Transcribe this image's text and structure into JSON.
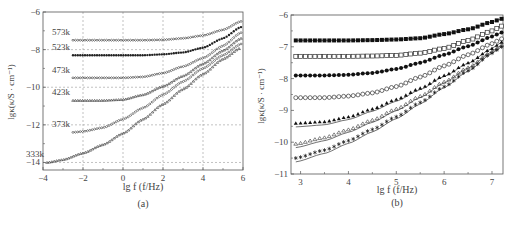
{
  "chart_data": [
    {
      "panel": "(a)",
      "type": "scatter",
      "title": "",
      "xlabel": "lg f (f/Hz)",
      "ylabel": "lgκ(κ/S · cm⁻¹)",
      "xlim": [
        -4,
        6
      ],
      "ylim": [
        -14.4,
        -6
      ],
      "xticks": [
        -4,
        -2,
        0,
        2,
        4,
        6
      ],
      "yticks": [
        -6,
        -8,
        -10,
        -12,
        -14
      ],
      "grid": true,
      "grid_style": "dashed",
      "legend": "inline labels",
      "series": [
        {
          "name": "573k",
          "marker": "open-diamond",
          "x": [
            -2.5,
            -1,
            0,
            1,
            2,
            3,
            4,
            5,
            5.9
          ],
          "y": [
            -7.5,
            -7.5,
            -7.5,
            -7.5,
            -7.48,
            -7.4,
            -7.25,
            -6.95,
            -6.5
          ]
        },
        {
          "name": "523k",
          "marker": "filled-dot",
          "x": [
            -2.5,
            -1,
            0,
            1,
            2,
            3,
            4,
            5,
            5.9
          ],
          "y": [
            -8.3,
            -8.3,
            -8.3,
            -8.3,
            -8.25,
            -8.15,
            -7.9,
            -7.4,
            -6.8
          ]
        },
        {
          "name": "473k",
          "marker": "open-diamond",
          "x": [
            -2.5,
            -1,
            0,
            1,
            2,
            3,
            4,
            5,
            5.9
          ],
          "y": [
            -9.5,
            -9.5,
            -9.5,
            -9.45,
            -9.25,
            -8.9,
            -8.45,
            -7.8,
            -7.1
          ]
        },
        {
          "name": "423k",
          "marker": "open-triangle",
          "x": [
            -2.5,
            -1,
            0,
            1,
            2,
            3,
            4,
            5,
            5.9
          ],
          "y": [
            -10.7,
            -10.7,
            -10.65,
            -10.4,
            -9.95,
            -9.4,
            -8.75,
            -8.05,
            -7.4
          ]
        },
        {
          "name": "373k",
          "marker": "open-diamond",
          "x": [
            -2.5,
            -2,
            -1,
            0,
            1,
            2,
            3,
            4,
            5,
            5.9
          ],
          "y": [
            -12.4,
            -12.35,
            -12.15,
            -11.7,
            -11.1,
            -10.4,
            -9.7,
            -9.0,
            -8.3,
            -7.7
          ]
        },
        {
          "name": "333k",
          "marker": "open-triangle",
          "x": [
            -3.8,
            -3,
            -2,
            -1,
            0,
            1,
            2,
            3,
            4,
            5,
            5.9
          ],
          "y": [
            -14.0,
            -13.85,
            -13.5,
            -13.05,
            -12.45,
            -11.7,
            -10.9,
            -10.1,
            -9.3,
            -8.5,
            -7.9
          ]
        }
      ]
    },
    {
      "panel": "(b)",
      "type": "scatter",
      "title": "",
      "xlabel": "lg f (f/Hz)",
      "ylabel": "lgκ(κ/S · cm⁻¹)",
      "xlim": [
        2.8,
        7.23
      ],
      "ylim": [
        -11,
        -6
      ],
      "xticks": [
        3,
        4,
        5,
        6,
        7
      ],
      "yticks": [
        -6,
        -7,
        -8,
        -9,
        -10,
        -11
      ],
      "grid": false,
      "legend": "none",
      "fit_lines": true,
      "series": [
        {
          "name": "series-1",
          "marker": "filled-square",
          "x": [
            2.9,
            3.5,
            4,
            4.5,
            5,
            5.5,
            6,
            6.5,
            7,
            7.2
          ],
          "y": [
            -6.8,
            -6.8,
            -6.8,
            -6.79,
            -6.77,
            -6.73,
            -6.6,
            -6.45,
            -6.22,
            -6.12
          ]
        },
        {
          "name": "series-2",
          "marker": "open-square",
          "x": [
            2.9,
            3.5,
            4,
            4.5,
            5,
            5.5,
            6,
            6.5,
            7,
            7.2
          ],
          "y": [
            -7.3,
            -7.3,
            -7.3,
            -7.29,
            -7.27,
            -7.2,
            -7.05,
            -6.8,
            -6.5,
            -6.35
          ]
        },
        {
          "name": "series-3",
          "marker": "filled-circle",
          "x": [
            2.9,
            3.5,
            4,
            4.5,
            5,
            5.5,
            6,
            6.5,
            7,
            7.2
          ],
          "y": [
            -7.9,
            -7.9,
            -7.88,
            -7.82,
            -7.7,
            -7.5,
            -7.25,
            -6.98,
            -6.68,
            -6.55
          ]
        },
        {
          "name": "series-4",
          "marker": "open-circle",
          "x": [
            2.9,
            3.5,
            4,
            4.5,
            5,
            5.5,
            6,
            6.5,
            7,
            7.2
          ],
          "y": [
            -8.6,
            -8.6,
            -8.55,
            -8.45,
            -8.25,
            -7.95,
            -7.6,
            -7.25,
            -6.9,
            -6.75
          ]
        },
        {
          "name": "series-5",
          "marker": "filled-triangle",
          "x": [
            2.9,
            3.5,
            4,
            4.5,
            5,
            5.5,
            6,
            6.5,
            7,
            7.2
          ],
          "y": [
            -9.4,
            -9.35,
            -9.2,
            -8.95,
            -8.65,
            -8.3,
            -7.9,
            -7.5,
            -7.05,
            -6.85
          ]
        },
        {
          "name": "series-6",
          "marker": "open-triangle",
          "x": [
            2.9,
            3.5,
            4,
            4.5,
            5,
            5.5,
            6,
            6.5,
            7,
            7.2
          ],
          "y": [
            -10.05,
            -9.85,
            -9.6,
            -9.3,
            -8.95,
            -8.55,
            -8.1,
            -7.65,
            -7.15,
            -6.95
          ]
        },
        {
          "name": "series-7",
          "marker": "asterisk",
          "x": [
            2.9,
            3.5,
            4,
            4.5,
            5,
            5.5,
            6,
            6.5,
            7,
            7.2
          ],
          "y": [
            -10.5,
            -10.25,
            -9.95,
            -9.6,
            -9.2,
            -8.75,
            -8.25,
            -7.75,
            -7.2,
            -7.0
          ]
        }
      ]
    }
  ],
  "panels": {
    "a": {
      "caption": "(a)",
      "xlabel": "lg f (f/Hz)",
      "ylabel": "lgκ(κ/S · cm⁻¹)"
    },
    "b": {
      "caption": "(b)",
      "xlabel": "lg f (f/Hz)",
      "ylabel": "lgκ(κ/S · cm⁻¹)"
    }
  }
}
